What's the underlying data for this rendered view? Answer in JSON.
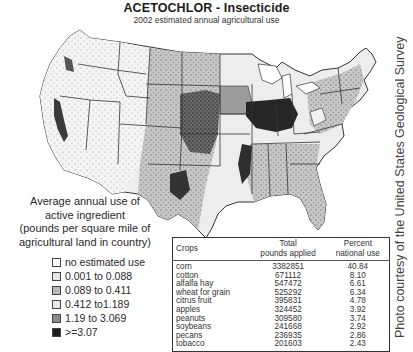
{
  "header": {
    "title": "ACETOCHLOR - Insecticide",
    "subtitle": "2002 estimated annual agricultural use"
  },
  "credit": "Photo courtesy of the United States Geological Survey",
  "legend": {
    "title_lines": [
      "Average annual use of",
      "active ingredient",
      "(pounds per square mile of",
      "agricultural land in country)"
    ],
    "items": [
      {
        "label": "no estimated use",
        "color": "#ffffff"
      },
      {
        "label": "0.001 to 0.088",
        "color": "#e4e4e4"
      },
      {
        "label": "0.089 to 0.411",
        "color": "#b8b8b8"
      },
      {
        "label": "0.412 to1.189",
        "color": "#e8e8e8"
      },
      {
        "label": "1.19 to 3.069",
        "color": "#8a8a8a"
      },
      {
        "label": ">=3.07",
        "color": "#1a1a1a"
      }
    ]
  },
  "table": {
    "headers": {
      "crops": "Crops",
      "total_line1": "Total",
      "total_line2": "pounds applied",
      "percent_line1": "Percent",
      "percent_line2": "national use"
    },
    "rows": [
      {
        "crop": "corn",
        "pounds": "3382851",
        "percent": "40.84"
      },
      {
        "crop": "cotton",
        "pounds": "671112",
        "percent": "8.10"
      },
      {
        "crop": "alfalfa hay",
        "pounds": "547472",
        "percent": "6.61"
      },
      {
        "crop": "wheat for grain",
        "pounds": "525292",
        "percent": "6.34"
      },
      {
        "crop": "citrus fruit",
        "pounds": "395831",
        "percent": "4.78"
      },
      {
        "crop": "apples",
        "pounds": "324452",
        "percent": "3.92"
      },
      {
        "crop": "peanuts",
        "pounds": "309580",
        "percent": "3.74"
      },
      {
        "crop": "soybeans",
        "pounds": "241668",
        "percent": "2.92"
      },
      {
        "crop": "pecans",
        "pounds": "236935",
        "percent": "2.86"
      },
      {
        "crop": "tobacco",
        "pounds": "201603",
        "percent": "2.43"
      }
    ]
  },
  "map": {
    "description": "Choropleth map of the contiguous United States showing estimated acetochlor use intensity by county",
    "colors": {
      "light": "#e6e6e6",
      "medium": "#b0b0b0",
      "dark": "#5a5a5a",
      "darkest": "#1e1e1e",
      "border": "#333333"
    }
  }
}
